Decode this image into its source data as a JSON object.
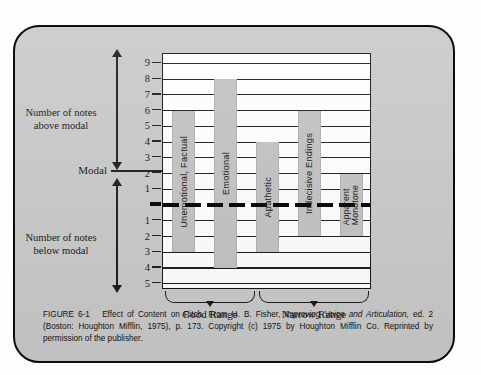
{
  "figure": {
    "caption_label": "FIGURE 6-1",
    "caption_title": "Effect of Content on Pitch.",
    "caption_source_pre": "From H. B. Fisher,",
    "caption_source_italic": "Improving Voice and Articulation,",
    "caption_source_post": "ed. 2 (Boston: Houghton Mifflin, 1975), p. 173. Copyright (c) 1975 by Houghton Mifflin Co. Reprinted by permission of the publisher."
  },
  "axis": {
    "label_above": "Number of notes above modal",
    "label_below": "Number of notes below modal",
    "label_modal": "Modal",
    "ticks_above": [
      "9",
      "8",
      "7",
      "6",
      "5",
      "4",
      "3",
      "2",
      "1"
    ],
    "ticks_below": [
      "1",
      "2",
      "3",
      "4",
      "5"
    ]
  },
  "ranges": [
    {
      "label": "Good Range"
    },
    {
      "label": "Narrow Range"
    }
  ],
  "colors": {
    "plate": "#c9c9c9",
    "bar": "#c2c2c2",
    "plot_bg": "#ffffff",
    "ink": "#111111"
  },
  "chart_data": {
    "type": "bar",
    "title": "Effect of Content on Pitch",
    "xlabel": "",
    "ylabel": "Number of notes above / below modal",
    "ylim": [
      -5,
      9
    ],
    "grid": true,
    "legend": "none",
    "note": "Floating range bars: each bar spans from its top (notes above modal) down to its bottom (notes below modal). Modal = 0.",
    "categories": [
      "Unemotional, Factual",
      "Emotional",
      "Apathetic",
      "Indecisive Endings",
      "Apparent Monotone"
    ],
    "series": [
      {
        "name": "Notes above modal",
        "values": [
          6,
          8,
          4,
          6,
          2
        ]
      },
      {
        "name": "Notes below modal",
        "values": [
          3,
          4,
          3,
          2,
          2
        ]
      }
    ],
    "bars": [
      {
        "label": "Unemotional, Factual",
        "top": 6,
        "bottom": -3,
        "range": 9,
        "group": "Good Range"
      },
      {
        "label": "Emotional",
        "top": 8,
        "bottom": -4,
        "range": 12,
        "group": "Good Range"
      },
      {
        "label": "Apathetic",
        "top": 4,
        "bottom": -3,
        "range": 7,
        "group": "Narrow Range"
      },
      {
        "label": "Indecisive Endings",
        "top": 6,
        "bottom": -2,
        "range": 8,
        "group": "Narrow Range"
      },
      {
        "label": "Apparent Monotone",
        "top": 2,
        "bottom": -2,
        "range": 4,
        "group": "Narrow Range"
      }
    ],
    "ytick_labels_above": [
      "9",
      "8",
      "7",
      "6",
      "5",
      "4",
      "3",
      "2",
      "1"
    ],
    "ytick_labels_below": [
      "1",
      "2",
      "3",
      "4",
      "5"
    ],
    "modal_line_value": 0,
    "modal_line_style": "thick dashed black"
  }
}
